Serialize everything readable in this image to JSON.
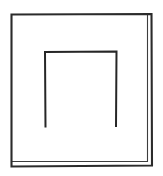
{
  "document": {
    "title": "Line Drawing",
    "background_color": "#ffffff",
    "width": 163,
    "height": 176
  },
  "figure": {
    "name": "square-frame-with-arch",
    "stroke_color": "#2b2b2b",
    "secondary_stroke_color": "#3d3d3d",
    "fill_color": "#ffffff",
    "outer_square": {
      "label": "outer square frame",
      "left": 11,
      "top": 13.5,
      "right": 152,
      "bottom": 166,
      "stroke_width": 2.1,
      "path": "M 11.5,14.5 L 151.5,14 L 152,165.5 L 11.5,166.5 Z"
    },
    "outer_square_inner_echo": {
      "label": "doubled sketch line along bottom and right",
      "stroke_width": 1.1,
      "path": "M 11.5,161.5 L 147.5,161.5 L 147.5,15.5"
    },
    "inner_arch": {
      "label": "inverted U arch",
      "left": 45,
      "top": 51.5,
      "right": 116.5,
      "bottom": 127.5,
      "stroke_width": 2.0,
      "path": "M 45.5,127.5 L 45,52 L 116.5,51.5 L 116,127"
    }
  }
}
